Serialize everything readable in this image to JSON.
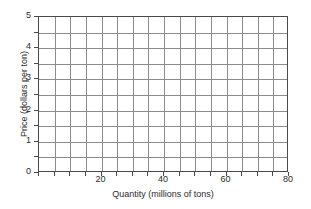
{
  "chart_data": {
    "type": "line",
    "title": "",
    "subtitle": "",
    "xlabel": "Quantity (millions of tons)",
    "ylabel": "Price (dollars per ton)",
    "xlim": [
      0,
      80
    ],
    "ylim": [
      0,
      5
    ],
    "x_major_ticks": [
      20,
      40,
      60,
      80
    ],
    "x_major_tick_labels": [
      "20",
      "40",
      "60",
      "80"
    ],
    "x_minor_tick_step": 5,
    "y_major_ticks": [
      0,
      1,
      2,
      3,
      4,
      5
    ],
    "y_major_tick_labels": [
      "0",
      "1",
      "2",
      "3",
      "4",
      "5"
    ],
    "y_minor_tick_step": 0.5,
    "grid": true,
    "grid_x_step": 5,
    "grid_y_step": 0.5,
    "grid_color": "#8c8c8c",
    "axis_color": "#4a4a4a",
    "background_color": "#ffffff",
    "legend": null,
    "legend_position": "none",
    "series": [],
    "annotations": [],
    "note": "Blank grid; no data series plotted."
  },
  "axes": {
    "x_tick_labels": [
      "20",
      "40",
      "60",
      "80"
    ],
    "y_tick_labels": [
      "5",
      "4",
      "3",
      "2",
      "1",
      "0"
    ],
    "x_title": "Quantity (millions of tons)",
    "y_title": "Price (dollars per ton)"
  }
}
